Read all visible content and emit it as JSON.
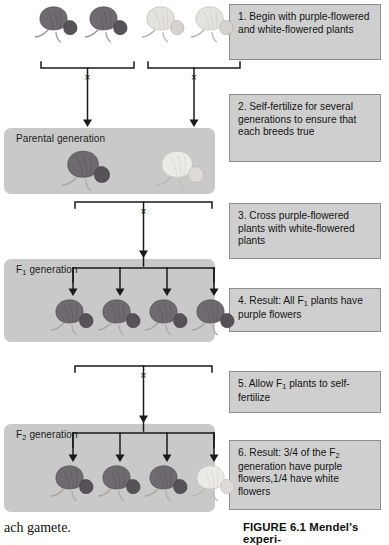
{
  "figure": {
    "caption": "FIGURE 6.1  Mendel's experi-",
    "body_text_fragment": "ach gamete."
  },
  "bands": [
    {
      "id": "parental",
      "label": "Parental generation"
    },
    {
      "id": "f1",
      "label_prefix": "F",
      "label_sub": "1",
      "label_suffix": " generation"
    },
    {
      "id": "f2",
      "label_prefix": "F",
      "label_sub": "2",
      "label_suffix": " generation"
    }
  ],
  "steps": [
    {
      "number": "1.",
      "text": "1. Begin with purple-flowered and white-flowered plants"
    },
    {
      "number": "2.",
      "text": "2. Self-fertilize for several generations to ensure that each breeds true"
    },
    {
      "number": "3.",
      "text": "3. Cross purple-flowered plants with white-flowered plants"
    },
    {
      "number": "4.",
      "text_before": "4. Result: All F",
      "sub": "1",
      "text_after": " plants have purple flowers"
    },
    {
      "number": "5.",
      "text_before": "5. Allow F",
      "sub": "1",
      "text_after": " plants to self-fertilize"
    },
    {
      "number": "6.",
      "text_before": "6. Result: 3/4 of the F",
      "sub": "2",
      "text_after": " generation have purple flowers,1/4 have white flowers"
    }
  ],
  "cross_symbol": "×",
  "generations": {
    "top_row": {
      "purple_plants": 2,
      "white_plants": 2
    },
    "parental": {
      "purple_plants": 1,
      "white_plants": 1
    },
    "f1": {
      "purple_plants": 4,
      "white_plants": 0
    },
    "f2": {
      "purple_plants": 3,
      "white_plants": 1
    }
  },
  "colors": {
    "band_fill": "#c9c9c9",
    "step_fill": "#cfcfcf",
    "step_border": "#8e8e8e",
    "line": "#1a1a1a",
    "purple_flower": "#6e6a70",
    "white_flower": "#e2e0de",
    "page_background": "#ffffff"
  }
}
